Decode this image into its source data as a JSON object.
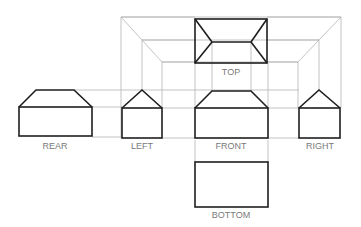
{
  "diagram": {
    "type": "orthographic-projection-views",
    "colors": {
      "object_line": "#1e1e1e",
      "projection_line": "#b4b4b4",
      "label": "#7a7a7a",
      "background": "#ffffff"
    },
    "views": [
      {
        "id": "top",
        "label": "TOP"
      },
      {
        "id": "rear",
        "label": "REAR"
      },
      {
        "id": "left",
        "label": "LEFT"
      },
      {
        "id": "front",
        "label": "FRONT"
      },
      {
        "id": "right",
        "label": "RIGHT"
      },
      {
        "id": "bottom",
        "label": "BOTTOM"
      }
    ]
  }
}
